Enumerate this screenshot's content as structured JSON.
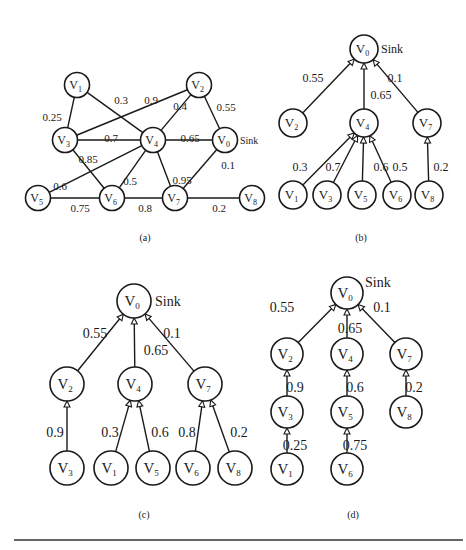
{
  "figure": {
    "panels": [
      {
        "id": "a",
        "caption": "(a)",
        "caption_pos": [
          145,
          241
        ],
        "kind": "graph",
        "radius": 12.5,
        "font_size": 12,
        "sub_size": 8,
        "edge_font_size": 11,
        "sink_label": "Sink",
        "sink_node": "0",
        "sink_offset": [
          15,
          4
        ],
        "sink_font_size": 10,
        "nodes": [
          {
            "id": "0",
            "label": "V",
            "sub": "0",
            "x": 225,
            "y": 140
          },
          {
            "id": "1",
            "label": "V",
            "sub": "1",
            "x": 77,
            "y": 85
          },
          {
            "id": "2",
            "label": "V",
            "sub": "2",
            "x": 199,
            "y": 85
          },
          {
            "id": "3",
            "label": "V",
            "sub": "3",
            "x": 65,
            "y": 140
          },
          {
            "id": "4",
            "label": "V",
            "sub": "4",
            "x": 153,
            "y": 140
          },
          {
            "id": "5",
            "label": "V",
            "sub": "5",
            "x": 38,
            "y": 198
          },
          {
            "id": "6",
            "label": "V",
            "sub": "6",
            "x": 112,
            "y": 198
          },
          {
            "id": "7",
            "label": "V",
            "sub": "7",
            "x": 175,
            "y": 198
          },
          {
            "id": "8",
            "label": "V",
            "sub": "8",
            "x": 252,
            "y": 198
          }
        ],
        "edges": [
          {
            "from": "1",
            "to": "3",
            "weight": "0.25",
            "lx": 52,
            "ly": 118
          },
          {
            "from": "1",
            "to": "4",
            "weight": "0.3",
            "lx": 121,
            "ly": 101
          },
          {
            "from": "3",
            "to": "2",
            "weight": "0.9",
            "lx": 151,
            "ly": 101
          },
          {
            "from": "2",
            "to": "4",
            "weight": "0.4",
            "lx": 180,
            "ly": 107
          },
          {
            "from": "2",
            "to": "0",
            "weight": "0.55",
            "lx": 226,
            "ly": 108
          },
          {
            "from": "3",
            "to": "4",
            "weight": "0.7",
            "lx": 111,
            "ly": 139
          },
          {
            "from": "4",
            "to": "0",
            "weight": "0.65",
            "lx": 190,
            "ly": 139
          },
          {
            "from": "3",
            "to": "6",
            "weight": "0.85",
            "lx": 88,
            "ly": 160
          },
          {
            "from": "4",
            "to": "5",
            "weight": "0.6",
            "lx": 60,
            "ly": 187
          },
          {
            "from": "4",
            "to": "6",
            "weight": "0.5",
            "lx": 130,
            "ly": 182
          },
          {
            "from": "4",
            "to": "7",
            "weight": "0.95",
            "lx": 182,
            "ly": 181
          },
          {
            "from": "0",
            "to": "7",
            "weight": "0.1",
            "lx": 228,
            "ly": 166
          },
          {
            "from": "5",
            "to": "6",
            "weight": "0.75",
            "lx": 80,
            "ly": 209
          },
          {
            "from": "6",
            "to": "7",
            "weight": "0.8",
            "lx": 145,
            "ly": 209
          },
          {
            "from": "7",
            "to": "8",
            "weight": "0.2",
            "lx": 219,
            "ly": 209
          }
        ]
      },
      {
        "id": "b",
        "caption": "(b)",
        "caption_pos": [
          361,
          241
        ],
        "kind": "tree",
        "radius": 14,
        "font_size": 13,
        "sub_size": 8,
        "edge_font_size": 12,
        "sink_label": "Sink",
        "sink_node": "0",
        "sink_offset": [
          17,
          4
        ],
        "sink_font_size": 12,
        "nodes": [
          {
            "id": "0",
            "label": "V",
            "sub": "0",
            "x": 364,
            "y": 49
          },
          {
            "id": "2",
            "label": "V",
            "sub": "2",
            "x": 293,
            "y": 123
          },
          {
            "id": "4",
            "label": "V",
            "sub": "4",
            "x": 364,
            "y": 123
          },
          {
            "id": "7",
            "label": "V",
            "sub": "7",
            "x": 427,
            "y": 123
          },
          {
            "id": "1",
            "label": "V",
            "sub": "1",
            "x": 293,
            "y": 195
          },
          {
            "id": "3",
            "label": "V",
            "sub": "3",
            "x": 327,
            "y": 195
          },
          {
            "id": "5",
            "label": "V",
            "sub": "5",
            "x": 362,
            "y": 195
          },
          {
            "id": "6",
            "label": "V",
            "sub": "6",
            "x": 397,
            "y": 195
          },
          {
            "id": "8",
            "label": "V",
            "sub": "8",
            "x": 429,
            "y": 195
          }
        ],
        "edges": [
          {
            "from": "2",
            "to": "0",
            "weight": "0.55",
            "lx": 313,
            "ly": 79
          },
          {
            "from": "4",
            "to": "0",
            "weight": "0.65",
            "lx": 381,
            "ly": 96
          },
          {
            "from": "7",
            "to": "0",
            "weight": "0.1",
            "lx": 395,
            "ly": 79
          },
          {
            "from": "1",
            "to": "4",
            "weight": "0.3",
            "lx": 300,
            "ly": 168
          },
          {
            "from": "3",
            "to": "4",
            "weight": "0.7",
            "lx": 333,
            "ly": 168
          },
          {
            "from": "5",
            "to": "4",
            "weight": "0.6",
            "lx": 381,
            "ly": 168
          },
          {
            "from": "6",
            "to": "4",
            "weight": "0.5",
            "lx": 400,
            "ly": 168
          },
          {
            "from": "8",
            "to": "7",
            "weight": "0.2",
            "lx": 441,
            "ly": 168
          }
        ]
      },
      {
        "id": "c",
        "caption": "(c)",
        "caption_pos": [
          144,
          518
        ],
        "kind": "tree",
        "radius": 17,
        "font_size": 15,
        "sub_size": 9,
        "edge_font_size": 14,
        "sink_label": "Sink",
        "sink_node": "0",
        "sink_offset": [
          21,
          5
        ],
        "sink_font_size": 14,
        "nodes": [
          {
            "id": "0",
            "label": "V",
            "sub": "0",
            "x": 134,
            "y": 301
          },
          {
            "id": "2",
            "label": "V",
            "sub": "2",
            "x": 67,
            "y": 384
          },
          {
            "id": "4",
            "label": "V",
            "sub": "4",
            "x": 135,
            "y": 384
          },
          {
            "id": "7",
            "label": "V",
            "sub": "7",
            "x": 205,
            "y": 384
          },
          {
            "id": "3",
            "label": "V",
            "sub": "3",
            "x": 67,
            "y": 468
          },
          {
            "id": "1",
            "label": "V",
            "sub": "1",
            "x": 111,
            "y": 468
          },
          {
            "id": "5",
            "label": "V",
            "sub": "5",
            "x": 153,
            "y": 468
          },
          {
            "id": "6",
            "label": "V",
            "sub": "6",
            "x": 193,
            "y": 468
          },
          {
            "id": "8",
            "label": "V",
            "sub": "8",
            "x": 235,
            "y": 468
          }
        ],
        "edges": [
          {
            "from": "2",
            "to": "0",
            "weight": "0.55",
            "lx": 95,
            "ly": 335
          },
          {
            "from": "4",
            "to": "0",
            "weight": "0.65",
            "lx": 156,
            "ly": 352
          },
          {
            "from": "7",
            "to": "0",
            "weight": "0.1",
            "lx": 172,
            "ly": 335
          },
          {
            "from": "3",
            "to": "2",
            "weight": "0.9",
            "lx": 55,
            "ly": 434
          },
          {
            "from": "1",
            "to": "4",
            "weight": "0.3",
            "lx": 110,
            "ly": 434
          },
          {
            "from": "5",
            "to": "4",
            "weight": "0.6",
            "lx": 160,
            "ly": 434
          },
          {
            "from": "6",
            "to": "7",
            "weight": "0.8",
            "lx": 187,
            "ly": 434
          },
          {
            "from": "8",
            "to": "7",
            "weight": "0.2",
            "lx": 239,
            "ly": 434
          }
        ]
      },
      {
        "id": "d",
        "caption": "(d)",
        "caption_pos": [
          353,
          518
        ],
        "kind": "tree",
        "radius": 16,
        "font_size": 15,
        "sub_size": 9,
        "edge_font_size": 14,
        "sink_label": "Sink",
        "sink_node": "0",
        "sink_offset": [
          18,
          -6
        ],
        "sink_font_size": 14,
        "nodes": [
          {
            "id": "0",
            "label": "V",
            "sub": "0",
            "x": 347,
            "y": 293
          },
          {
            "id": "2",
            "label": "V",
            "sub": "2",
            "x": 287,
            "y": 354
          },
          {
            "id": "4",
            "label": "V",
            "sub": "4",
            "x": 347,
            "y": 354
          },
          {
            "id": "7",
            "label": "V",
            "sub": "7",
            "x": 406,
            "y": 354
          },
          {
            "id": "3",
            "label": "V",
            "sub": "3",
            "x": 287,
            "y": 412
          },
          {
            "id": "5",
            "label": "V",
            "sub": "5",
            "x": 347,
            "y": 412
          },
          {
            "id": "8",
            "label": "V",
            "sub": "8",
            "x": 406,
            "y": 412
          },
          {
            "id": "1",
            "label": "V",
            "sub": "1",
            "x": 287,
            "y": 469
          },
          {
            "id": "6",
            "label": "V",
            "sub": "6",
            "x": 347,
            "y": 469
          }
        ],
        "edges": [
          {
            "from": "2",
            "to": "0",
            "weight": "0.55",
            "lx": 282,
            "ly": 309
          },
          {
            "from": "4",
            "to": "0",
            "weight": "0.65",
            "lx": 350,
            "ly": 330
          },
          {
            "from": "7",
            "to": "0",
            "weight": "0.1",
            "lx": 382,
            "ly": 309
          },
          {
            "from": "3",
            "to": "2",
            "weight": "0.9",
            "lx": 295,
            "ly": 389
          },
          {
            "from": "5",
            "to": "4",
            "weight": "0.6",
            "lx": 355,
            "ly": 389
          },
          {
            "from": "8",
            "to": "7",
            "weight": "0.2",
            "lx": 414,
            "ly": 389
          },
          {
            "from": "1",
            "to": "3",
            "weight": "0.25",
            "lx": 295,
            "ly": 447
          },
          {
            "from": "6",
            "to": "5",
            "weight": "0.75",
            "lx": 355,
            "ly": 447
          }
        ]
      }
    ],
    "bottom_rule": {
      "x1": 14,
      "x2": 463,
      "y": 540
    }
  }
}
